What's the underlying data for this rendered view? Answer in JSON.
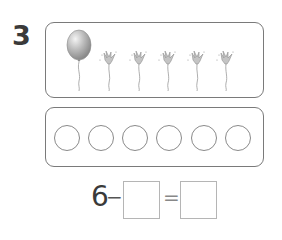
{
  "problem": {
    "number": "3",
    "picture": {
      "balloons_intact": 1,
      "balloons_popped": 5,
      "items": [
        "balloon",
        "popped-balloon",
        "popped-balloon",
        "popped-balloon",
        "popped-balloon",
        "popped-balloon"
      ]
    },
    "circles": {
      "count": 6
    },
    "equation": {
      "minuend": "6",
      "minus": "−",
      "equals": "=",
      "subtrahend_value": "",
      "result_value": ""
    }
  }
}
